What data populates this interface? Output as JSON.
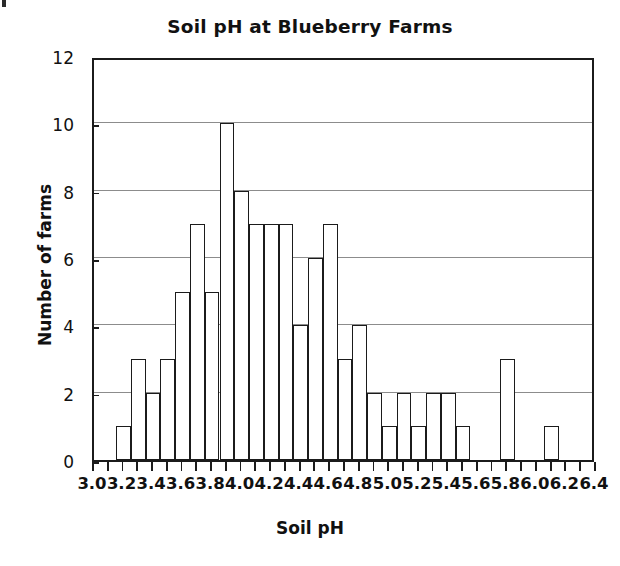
{
  "chart_data": {
    "type": "bar",
    "title": "Soil pH at Blueberry Farms",
    "xlabel": "Soil pH",
    "ylabel": "Number of farms",
    "grid": "horizontal",
    "legend": "none",
    "bin_width": 0.1,
    "xlim": [
      3.0,
      6.4
    ],
    "ylim": [
      0,
      12
    ],
    "xticks": [
      3.0,
      3.1,
      3.2,
      3.3,
      3.4,
      3.5,
      3.6,
      3.7,
      3.8,
      3.9,
      4.0,
      4.1,
      4.2,
      4.3,
      4.4,
      4.5,
      4.6,
      4.7,
      4.8,
      4.9,
      5.0,
      5.1,
      5.2,
      5.3,
      5.4,
      5.5,
      5.6,
      5.7,
      5.8,
      5.9,
      6.0,
      6.1,
      6.2,
      6.3,
      6.4
    ],
    "xtick_labels": [
      {
        "value": 3.0,
        "text": "3.0"
      },
      {
        "value": 3.2,
        "text": "3.2"
      },
      {
        "value": 3.4,
        "text": "3.4"
      },
      {
        "value": 3.6,
        "text": "3.6"
      },
      {
        "value": 3.8,
        "text": "3.8"
      },
      {
        "value": 4.0,
        "text": "4.0"
      },
      {
        "value": 4.2,
        "text": "4.2"
      },
      {
        "value": 4.4,
        "text": "4.4"
      },
      {
        "value": 4.6,
        "text": "4.6"
      },
      {
        "value": 4.8,
        "text": "4.8"
      },
      {
        "value": 5.0,
        "text": "5.0"
      },
      {
        "value": 5.2,
        "text": "5.2"
      },
      {
        "value": 5.4,
        "text": "5.4"
      },
      {
        "value": 5.6,
        "text": "5.6"
      },
      {
        "value": 5.8,
        "text": "5.8"
      },
      {
        "value": 6.0,
        "text": "6.0"
      },
      {
        "value": 6.2,
        "text": "6.2"
      },
      {
        "value": 6.4,
        "text": "6.4"
      }
    ],
    "yticks": [
      0,
      2,
      4,
      6,
      8,
      10,
      12
    ],
    "ytick_labels": [
      "0",
      "2",
      "4",
      "6",
      "8",
      "10",
      "12"
    ],
    "bins": [
      {
        "start": 3.15,
        "end": 3.25,
        "count": 1
      },
      {
        "start": 3.25,
        "end": 3.35,
        "count": 3
      },
      {
        "start": 3.35,
        "end": 3.45,
        "count": 2
      },
      {
        "start": 3.45,
        "end": 3.55,
        "count": 3
      },
      {
        "start": 3.55,
        "end": 3.65,
        "count": 5
      },
      {
        "start": 3.65,
        "end": 3.75,
        "count": 7
      },
      {
        "start": 3.75,
        "end": 3.85,
        "count": 5
      },
      {
        "start": 3.85,
        "end": 3.95,
        "count": 10
      },
      {
        "start": 3.95,
        "end": 4.05,
        "count": 8
      },
      {
        "start": 4.05,
        "end": 4.15,
        "count": 7
      },
      {
        "start": 4.15,
        "end": 4.25,
        "count": 7
      },
      {
        "start": 4.25,
        "end": 4.35,
        "count": 7
      },
      {
        "start": 4.35,
        "end": 4.45,
        "count": 4
      },
      {
        "start": 4.45,
        "end": 4.55,
        "count": 6
      },
      {
        "start": 4.55,
        "end": 4.65,
        "count": 7
      },
      {
        "start": 4.65,
        "end": 4.75,
        "count": 3
      },
      {
        "start": 4.75,
        "end": 4.85,
        "count": 4
      },
      {
        "start": 4.85,
        "end": 4.95,
        "count": 2
      },
      {
        "start": 4.95,
        "end": 5.05,
        "count": 1
      },
      {
        "start": 5.05,
        "end": 5.15,
        "count": 2
      },
      {
        "start": 5.15,
        "end": 5.25,
        "count": 1
      },
      {
        "start": 5.25,
        "end": 5.35,
        "count": 2
      },
      {
        "start": 5.35,
        "end": 5.45,
        "count": 2
      },
      {
        "start": 5.45,
        "end": 5.55,
        "count": 1
      },
      {
        "start": 5.75,
        "end": 5.85,
        "count": 3
      },
      {
        "start": 6.05,
        "end": 6.15,
        "count": 1
      }
    ],
    "colors": {
      "bar_fill": "#ffffff",
      "bar_stroke": "#1b1b1b",
      "gridline": "#8c8c8c",
      "axis": "#1b1b1b",
      "text": "#111111"
    }
  }
}
